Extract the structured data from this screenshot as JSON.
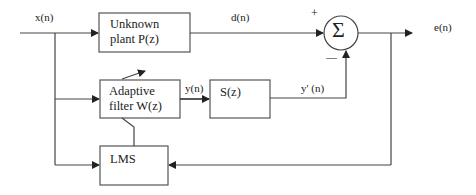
{
  "diagram": {
    "type": "block-diagram",
    "title": "",
    "signals": {
      "input": "x(n)",
      "desired": "d(n)",
      "output": "e(n)",
      "filter_out": "y(n)",
      "secondary_out": "y' (n)"
    },
    "blocks": {
      "plant": {
        "line1": "Unknown",
        "line2": "plant P(z)"
      },
      "adaptive": {
        "line1": "Adaptive",
        "line2": "filter W(z)"
      },
      "secondary": {
        "label": "S(z)"
      },
      "lms": {
        "label": "LMS"
      },
      "summer": {
        "symbol": "Σ",
        "plus": "+",
        "minus": "—"
      }
    },
    "colors": {
      "line": "#333333",
      "text": "#222222",
      "background": "#ffffff"
    }
  }
}
